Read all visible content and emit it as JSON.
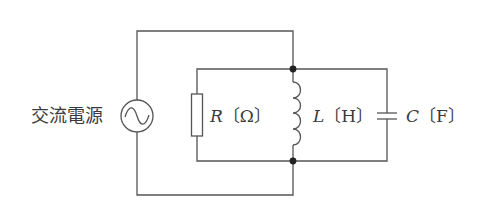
{
  "diagram": {
    "type": "parallel RLC circuit",
    "source": {
      "label": "交流電源",
      "icon": "ac-source-sine-icon"
    },
    "components": [
      {
        "id": "resistor",
        "symbol": "R",
        "unit": "〔Ω〕"
      },
      {
        "id": "inductor",
        "symbol": "L",
        "unit": "〔H〕"
      },
      {
        "id": "capacitor",
        "symbol": "C",
        "unit": "〔F〕"
      }
    ],
    "colors": {
      "wire": "#555555",
      "text": "#3a3a3a",
      "junction": "#222222",
      "background": "#ffffff"
    }
  }
}
